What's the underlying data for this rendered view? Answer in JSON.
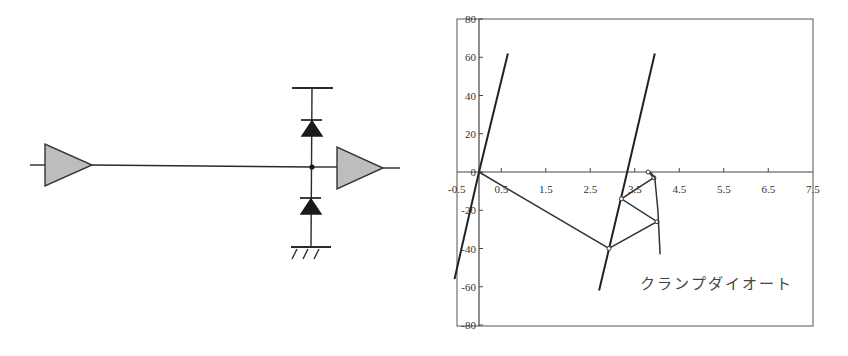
{
  "circuit": {
    "title": "",
    "components": {
      "driver_buffer": {
        "type": "buffer",
        "fill": "#bdbdbd"
      },
      "receiver_buffer": {
        "type": "buffer",
        "fill": "#bdbdbd"
      },
      "upper_clamp_diode": {
        "type": "diode",
        "to": "supply"
      },
      "lower_clamp_diode": {
        "type": "diode",
        "to": "ground"
      },
      "supply_rail": {
        "type": "rail"
      },
      "ground": {
        "type": "ground"
      }
    }
  },
  "chart_data": {
    "type": "line",
    "title": "",
    "xlabel": "",
    "ylabel": "",
    "xlim": [
      -0.5,
      7.5
    ],
    "ylim": [
      -80,
      80
    ],
    "x_ticks": [
      -0.5,
      0.5,
      1.5,
      2.5,
      3.5,
      4.5,
      5.5,
      6.5,
      7.5
    ],
    "x_tick_labels": [
      "-0.5",
      "0.5",
      "1.5",
      "2.5",
      "3.5",
      "4.5",
      "5.5",
      "6.5",
      "7.5"
    ],
    "y_ticks": [
      80,
      60,
      40,
      20,
      0,
      -20,
      -40,
      -60,
      -80
    ],
    "y_tick_labels": [
      "80",
      "60",
      "40",
      "20",
      "0",
      "-20",
      "-40",
      "-60",
      "-80"
    ],
    "grid": false,
    "legend": null,
    "series": [
      {
        "name": "driver-load-line-low",
        "x": [
          -0.55,
          0.0,
          0.65
        ],
        "y": [
          -56,
          0,
          62
        ]
      },
      {
        "name": "driver-load-line-high",
        "x": [
          2.7,
          3.33,
          3.95
        ],
        "y": [
          -62,
          0,
          62
        ]
      },
      {
        "name": "reflection-bounce-diagram",
        "x": [
          0.0,
          2.92,
          4.0,
          3.2,
          3.93,
          3.8
        ],
        "y": [
          0,
          -40,
          -26,
          -14,
          -3,
          0
        ]
      },
      {
        "name": "clamp-diode-characteristic",
        "x": [
          3.85,
          3.95,
          4.02,
          4.07
        ],
        "y": [
          0,
          -3,
          -20,
          -43
        ]
      }
    ],
    "annotations": [
      {
        "text": "クランプダイオート",
        "x": 3.7,
        "y": -58,
        "points_to": "clamp-diode-characteristic"
      }
    ]
  }
}
